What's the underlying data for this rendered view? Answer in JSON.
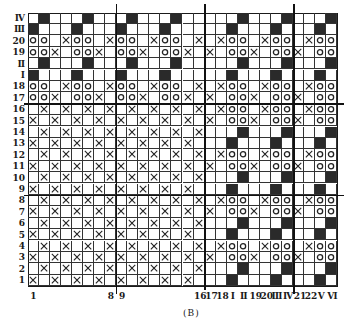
{
  "diagram": {
    "caption": "(B)",
    "legend_codes": {
      ".": "empty",
      "X": "cross",
      "O": "circle",
      "#": "filled"
    },
    "row_labels": [
      "Ⅳ",
      "Ⅲ",
      "20",
      "19",
      "Ⅱ",
      "Ⅰ",
      "18",
      "17",
      "16",
      "15",
      "14",
      "13",
      "12",
      "11",
      "10",
      "9",
      "8",
      "7",
      "6",
      "5",
      "4",
      "3",
      "2",
      "1"
    ],
    "col_labels": [
      {
        "col": 1,
        "label": "1"
      },
      {
        "col": 8,
        "label": "8"
      },
      {
        "col": 9,
        "label": "9"
      },
      {
        "col": 16,
        "label": "16"
      },
      {
        "col": 17,
        "label": "17"
      },
      {
        "col": 18,
        "label": "18"
      },
      {
        "col": 19,
        "label": "Ⅰ"
      },
      {
        "col": 20,
        "label": "Ⅱ"
      },
      {
        "col": 21,
        "label": "19"
      },
      {
        "col": 22,
        "label": "20"
      },
      {
        "col": 23,
        "label": "Ⅲ"
      },
      {
        "col": 24,
        "label": "Ⅳ"
      },
      {
        "col": 25,
        "label": "21"
      },
      {
        "col": 26,
        "label": "22"
      },
      {
        "col": 27,
        "label": "Ⅴ"
      },
      {
        "col": 28,
        "label": "Ⅵ"
      }
    ],
    "rows": [
      ".#...#...#...#.....#...#...#",
      "#...#...#...#.....#...#...#.",
      "OO.XOO.XOO.XOO.X.XOO.XOO.XOO",
      "OOX.OOX.OOX.OOX.X.OOX.OOX.OO",
      ".#...#...#...#.....#...#...#",
      "#...#...#...#.....#...#...#.",
      "OO.XOO.XOO.XOO.X.XOO.XOO.XOO",
      "OOX.OOX.OOX.OOX.X.OOX.OOX.OO",
      ".X.X.X.X.X.X.X.X.XOO.XOO.XOO",
      "X.X.X.X.X.X.X.X.X.OOX.OOX.OO",
      ".X.X.X.X.X.X.X.X...#...#...#",
      "X.X.X.X.X.X.X.X...#...#...#.",
      ".X.X.X.X.X.X.X.X.XOO.XOO.XOO",
      "X.X.X.X.X.X.X.X.X.OOX.OOX.OO",
      ".X.X.X.X.X.X.X.X...#...#...#",
      "X.X.X.X.X.X.X.X...#...#...#.",
      ".X.X.X.X.X.X.X.X.XOO.XOO.XOO",
      "X.X.X.X.X.X.X.X.X.OOX.OOX.OO",
      ".X.X.X.X.X.X.X.X...#...#...#",
      "X.X.X.X.X.X.X.X...#...#...#.",
      ".X.X.X.X.X.X.X.X.XOO.XOO.XOO",
      "X.X.X.X.X.X.X.X.X.OOX.OOX.OO",
      ".X.X.X.X.X.X.X.X...#...#...#",
      "X.X.X.X.X.X.X.X...#...#...#."
    ],
    "thick_vertical_after_cols": [
      8,
      16,
      24
    ],
    "thick_horizontal_after_rows": [
      8,
      16
    ],
    "colors": {
      "ink": "#1a1a1a",
      "fill": "#2a2a2a",
      "background": "#ffffff"
    }
  }
}
